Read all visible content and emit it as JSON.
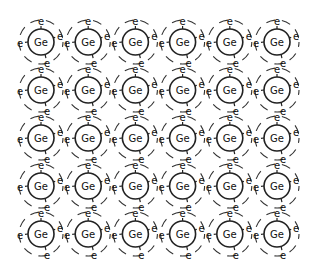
{
  "diagram": {
    "title": "",
    "atom_label": "Ge",
    "electron_label": "e",
    "rows": 5,
    "cols": 6,
    "atom_label_text": "Ge",
    "grid": {
      "x0": 41,
      "dx": 47.2,
      "y0": 42,
      "dy": 48,
      "atom_radius": 13,
      "shell_radius": 22
    },
    "electron_offsets": [
      {
        "name": "top",
        "dx": 0,
        "dy": -21,
        "bond_to": [
          0,
          -13
        ]
      },
      {
        "name": "left",
        "dx": -21,
        "dy": 1,
        "bond_to": [
          -13,
          0
        ]
      },
      {
        "name": "right",
        "dx": 19,
        "dy": -6,
        "bond_to": [
          12,
          -4
        ]
      },
      {
        "name": "bottom",
        "dx": 6,
        "dy": 21,
        "bond_to": [
          4,
          12
        ]
      }
    ],
    "colors": {
      "stroke": "#222222",
      "background": "#ffffff"
    }
  }
}
